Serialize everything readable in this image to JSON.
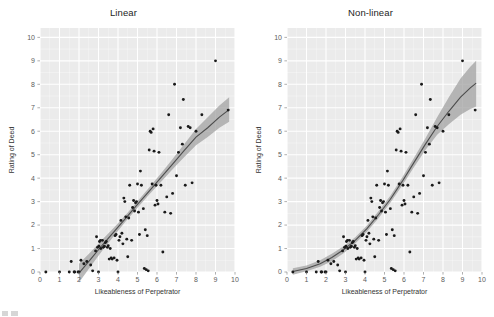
{
  "figure": {
    "background": "#ffffff",
    "panel_background": "#ebebeb",
    "grid_color": "#ffffff",
    "point_color": "#1a1a1a",
    "line_color": "#4d4d4d",
    "band_color": "#9e9e9e",
    "axis_text_color": "#5c5c5c"
  },
  "chart_data": [
    {
      "type": "scatter",
      "panel": "left",
      "title": "Linear",
      "xlabel": "Likeableness of Perpetrator",
      "ylabel": "Rating of Deed",
      "xlim": [
        0,
        10
      ],
      "ylim": [
        0,
        10.4
      ],
      "xticks": [
        0,
        1,
        2,
        3,
        4,
        5,
        6,
        7,
        8,
        9,
        10
      ],
      "yticks": [
        0,
        1,
        2,
        3,
        4,
        5,
        6,
        7,
        8,
        9,
        10
      ],
      "grid": true,
      "legend": "none",
      "fit": {
        "model": "linear",
        "label": "least-squares line with 95% confidence band",
        "x": [
          2.0,
          2.6,
          3.2,
          3.8,
          4.4,
          5.0,
          5.6,
          6.2,
          6.8,
          7.4,
          8.0,
          8.6,
          9.2,
          9.7
        ],
        "y": [
          -0.05,
          0.55,
          1.15,
          1.72,
          2.3,
          2.88,
          3.45,
          4.02,
          4.6,
          5.18,
          5.75,
          6.15,
          6.6,
          6.92
        ],
        "ci_lower": [
          -0.45,
          0.25,
          0.92,
          1.55,
          2.16,
          2.74,
          3.3,
          3.84,
          4.38,
          4.9,
          5.4,
          5.75,
          6.15,
          6.4
        ],
        "ci_upper": [
          0.35,
          0.85,
          1.38,
          1.9,
          2.44,
          3.02,
          3.6,
          4.2,
          4.82,
          5.46,
          6.1,
          6.6,
          7.1,
          7.45
        ]
      },
      "points": [
        [
          0.3,
          0.0
        ],
        [
          1.0,
          0.0
        ],
        [
          1.5,
          0.0
        ],
        [
          1.6,
          0.45
        ],
        [
          1.75,
          0.0
        ],
        [
          1.78,
          0.0
        ],
        [
          1.95,
          0.0
        ],
        [
          2.0,
          0.0
        ],
        [
          2.1,
          0.5
        ],
        [
          2.25,
          0.35
        ],
        [
          2.4,
          0.45
        ],
        [
          2.6,
          0.3
        ],
        [
          2.7,
          0.05
        ],
        [
          2.85,
          0.9
        ],
        [
          2.9,
          1.5
        ],
        [
          2.95,
          1.05
        ],
        [
          3.0,
          0.0
        ],
        [
          3.02,
          1.1
        ],
        [
          3.05,
          1.3
        ],
        [
          3.1,
          1.35
        ],
        [
          3.12,
          1.0
        ],
        [
          3.2,
          1.35
        ],
        [
          3.25,
          1.05
        ],
        [
          3.3,
          1.1
        ],
        [
          3.35,
          1.25
        ],
        [
          3.4,
          1.3
        ],
        [
          3.45,
          1.05
        ],
        [
          3.5,
          1.12
        ],
        [
          3.55,
          0.55
        ],
        [
          3.6,
          1.0
        ],
        [
          3.65,
          0.6
        ],
        [
          3.7,
          0.55
        ],
        [
          3.8,
          0.6
        ],
        [
          3.85,
          1.55
        ],
        [
          3.9,
          1.6
        ],
        [
          3.95,
          0.5
        ],
        [
          4.0,
          0.0
        ],
        [
          4.05,
          1.35
        ],
        [
          4.1,
          1.5
        ],
        [
          4.15,
          2.2
        ],
        [
          4.2,
          1.65
        ],
        [
          4.25,
          1.2
        ],
        [
          4.3,
          3.15
        ],
        [
          4.35,
          3.0
        ],
        [
          4.4,
          2.35
        ],
        [
          4.45,
          1.4
        ],
        [
          4.5,
          0.65
        ],
        [
          4.55,
          2.3
        ],
        [
          4.6,
          3.7
        ],
        [
          4.7,
          1.35
        ],
        [
          4.75,
          2.75
        ],
        [
          4.8,
          3.05
        ],
        [
          4.85,
          2.6
        ],
        [
          4.9,
          2.95
        ],
        [
          4.95,
          3.0
        ],
        [
          5.0,
          3.75
        ],
        [
          5.05,
          2.55
        ],
        [
          5.1,
          1.6
        ],
        [
          5.15,
          4.3
        ],
        [
          5.2,
          3.7
        ],
        [
          5.3,
          2.7
        ],
        [
          5.35,
          0.15
        ],
        [
          5.4,
          1.8
        ],
        [
          5.45,
          0.1
        ],
        [
          5.5,
          1.55
        ],
        [
          5.55,
          0.05
        ],
        [
          5.6,
          5.2
        ],
        [
          5.65,
          6.0
        ],
        [
          5.7,
          5.95
        ],
        [
          5.75,
          3.75
        ],
        [
          5.8,
          6.1
        ],
        [
          5.85,
          5.15
        ],
        [
          5.9,
          2.85
        ],
        [
          5.95,
          3.7
        ],
        [
          6.0,
          3.05
        ],
        [
          6.05,
          2.9
        ],
        [
          6.1,
          5.1
        ],
        [
          6.2,
          3.7
        ],
        [
          6.3,
          0.85
        ],
        [
          6.4,
          2.55
        ],
        [
          6.5,
          3.2
        ],
        [
          6.6,
          6.7
        ],
        [
          6.7,
          2.5
        ],
        [
          6.8,
          3.35
        ],
        [
          6.9,
          8.0
        ],
        [
          7.0,
          4.1
        ],
        [
          7.1,
          5.1
        ],
        [
          7.2,
          6.15
        ],
        [
          7.3,
          5.45
        ],
        [
          7.35,
          7.35
        ],
        [
          7.45,
          3.7
        ],
        [
          7.6,
          6.2
        ],
        [
          7.7,
          6.15
        ],
        [
          7.8,
          3.8
        ],
        [
          8.0,
          6.0
        ],
        [
          8.3,
          6.7
        ],
        [
          9.0,
          9.0
        ],
        [
          9.65,
          6.9
        ]
      ]
    },
    {
      "type": "scatter",
      "panel": "right",
      "title": "Non-linear",
      "xlabel": "Likeableness of Perpetrator",
      "ylabel": "Rating of Deed",
      "xlim": [
        0,
        10
      ],
      "ylim": [
        0,
        10.4
      ],
      "xticks": [
        0,
        1,
        2,
        3,
        4,
        5,
        6,
        7,
        8,
        9,
        10
      ],
      "yticks": [
        0,
        1,
        2,
        3,
        4,
        5,
        6,
        7,
        8,
        9,
        10
      ],
      "grid": true,
      "legend": "none",
      "fit": {
        "model": "non-linear",
        "label": "smoothed curve with 95% confidence band",
        "x": [
          0.3,
          1.0,
          1.7,
          2.3,
          2.9,
          3.5,
          4.1,
          4.7,
          5.3,
          5.9,
          6.5,
          7.1,
          7.7,
          8.3,
          8.9,
          9.4,
          9.7
        ],
        "y": [
          0.02,
          0.15,
          0.35,
          0.62,
          0.95,
          1.35,
          1.85,
          2.45,
          3.1,
          3.85,
          4.65,
          5.45,
          6.2,
          6.85,
          7.45,
          7.85,
          8.05
        ],
        "ci_lower": [
          -0.12,
          0.03,
          0.22,
          0.46,
          0.8,
          1.22,
          1.72,
          2.3,
          2.95,
          3.68,
          4.45,
          5.2,
          5.85,
          6.3,
          6.7,
          6.95,
          7.05
        ],
        "ci_upper": [
          0.16,
          0.28,
          0.5,
          0.78,
          1.1,
          1.48,
          1.98,
          2.6,
          3.25,
          4.02,
          4.85,
          5.7,
          6.6,
          7.45,
          8.25,
          8.75,
          9.0
        ]
      },
      "points": [
        [
          0.3,
          0.0
        ],
        [
          1.0,
          0.0
        ],
        [
          1.5,
          0.0
        ],
        [
          1.6,
          0.45
        ],
        [
          1.75,
          0.0
        ],
        [
          1.78,
          0.0
        ],
        [
          1.95,
          0.0
        ],
        [
          2.0,
          0.0
        ],
        [
          2.1,
          0.5
        ],
        [
          2.25,
          0.35
        ],
        [
          2.4,
          0.45
        ],
        [
          2.6,
          0.3
        ],
        [
          2.7,
          0.05
        ],
        [
          2.85,
          0.9
        ],
        [
          2.9,
          1.5
        ],
        [
          2.95,
          1.05
        ],
        [
          3.0,
          0.0
        ],
        [
          3.02,
          1.1
        ],
        [
          3.05,
          1.3
        ],
        [
          3.1,
          1.35
        ],
        [
          3.12,
          1.0
        ],
        [
          3.2,
          1.35
        ],
        [
          3.25,
          1.05
        ],
        [
          3.3,
          1.1
        ],
        [
          3.35,
          1.25
        ],
        [
          3.4,
          1.3
        ],
        [
          3.45,
          1.05
        ],
        [
          3.5,
          1.12
        ],
        [
          3.55,
          0.55
        ],
        [
          3.6,
          1.0
        ],
        [
          3.65,
          0.6
        ],
        [
          3.7,
          0.55
        ],
        [
          3.8,
          0.6
        ],
        [
          3.85,
          1.55
        ],
        [
          3.9,
          1.6
        ],
        [
          3.95,
          0.5
        ],
        [
          4.0,
          0.0
        ],
        [
          4.05,
          1.35
        ],
        [
          4.1,
          1.5
        ],
        [
          4.15,
          2.2
        ],
        [
          4.2,
          1.65
        ],
        [
          4.25,
          1.2
        ],
        [
          4.3,
          3.15
        ],
        [
          4.35,
          3.0
        ],
        [
          4.4,
          2.35
        ],
        [
          4.45,
          1.4
        ],
        [
          4.5,
          0.65
        ],
        [
          4.55,
          2.3
        ],
        [
          4.6,
          3.7
        ],
        [
          4.7,
          1.35
        ],
        [
          4.75,
          2.75
        ],
        [
          4.8,
          3.05
        ],
        [
          4.85,
          2.6
        ],
        [
          4.9,
          2.95
        ],
        [
          4.95,
          3.0
        ],
        [
          5.0,
          3.75
        ],
        [
          5.05,
          2.55
        ],
        [
          5.1,
          1.6
        ],
        [
          5.15,
          4.3
        ],
        [
          5.2,
          3.7
        ],
        [
          5.3,
          2.7
        ],
        [
          5.35,
          0.15
        ],
        [
          5.4,
          1.8
        ],
        [
          5.45,
          0.1
        ],
        [
          5.5,
          1.55
        ],
        [
          5.55,
          0.05
        ],
        [
          5.6,
          5.2
        ],
        [
          5.65,
          6.0
        ],
        [
          5.7,
          5.95
        ],
        [
          5.75,
          3.75
        ],
        [
          5.8,
          6.1
        ],
        [
          5.85,
          5.15
        ],
        [
          5.9,
          2.85
        ],
        [
          5.95,
          3.7
        ],
        [
          6.0,
          3.05
        ],
        [
          6.05,
          2.9
        ],
        [
          6.1,
          5.1
        ],
        [
          6.2,
          3.7
        ],
        [
          6.3,
          0.85
        ],
        [
          6.4,
          2.55
        ],
        [
          6.5,
          3.2
        ],
        [
          6.6,
          6.7
        ],
        [
          6.7,
          2.5
        ],
        [
          6.8,
          3.35
        ],
        [
          6.9,
          8.0
        ],
        [
          7.0,
          4.1
        ],
        [
          7.1,
          5.1
        ],
        [
          7.2,
          6.15
        ],
        [
          7.3,
          5.45
        ],
        [
          7.35,
          7.35
        ],
        [
          7.45,
          3.7
        ],
        [
          7.6,
          6.2
        ],
        [
          7.7,
          6.15
        ],
        [
          7.8,
          3.8
        ],
        [
          8.0,
          6.0
        ],
        [
          8.3,
          6.7
        ],
        [
          9.0,
          9.0
        ],
        [
          9.65,
          6.9
        ]
      ]
    }
  ]
}
